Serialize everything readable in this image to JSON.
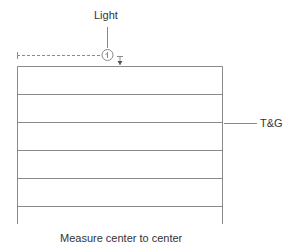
{
  "labels": {
    "light": "Light",
    "tg": "T&G",
    "caption": "Measure center to center"
  },
  "fixture_symbol": "+",
  "colors": {
    "line": "#8a8a8a",
    "text": "#333333"
  },
  "board_count": 6
}
